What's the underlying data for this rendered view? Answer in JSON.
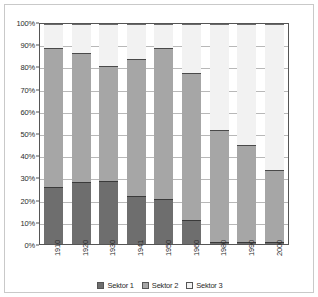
{
  "chart_data": {
    "type": "bar",
    "stacked": true,
    "stack_mode": "percent",
    "title": "",
    "subtitle": "",
    "xlabel": "",
    "ylabel": "",
    "ylim": [
      0,
      100
    ],
    "ytick_labels": [
      "100%",
      "90%",
      "80%",
      "70%",
      "60%",
      "50%",
      "40%",
      "30%",
      "20%",
      "10%",
      "0%"
    ],
    "ytick_values": [
      100,
      90,
      80,
      70,
      60,
      50,
      40,
      30,
      20,
      10,
      0
    ],
    "grid": true,
    "grid_axis": "y",
    "legend_position": "bottom",
    "categories": [
      "1910",
      "1920",
      "1930",
      "1941",
      "1950",
      "1960",
      "1980",
      "1990",
      "2000"
    ],
    "series": [
      {
        "name": "Sektor 1",
        "color": "#6e6e6e",
        "values": [
          26.0,
          28.0,
          28.5,
          22.0,
          20.5,
          11.0,
          1.0,
          1.0,
          1.0
        ]
      },
      {
        "name": "Sektor 2",
        "color": "#a6a6a6",
        "values": [
          63.0,
          59.0,
          52.5,
          62.0,
          68.5,
          66.5,
          51.0,
          44.0,
          32.5
        ]
      },
      {
        "name": "Sektor 3",
        "color": "#f2f2f2",
        "values": [
          11.0,
          13.0,
          19.0,
          16.0,
          11.0,
          22.5,
          48.0,
          55.0,
          66.5
        ]
      }
    ],
    "cumulative_tops": [
      {
        "category": "1910",
        "s1_top": 26.0,
        "s2_top": 89.0
      },
      {
        "category": "1920",
        "s1_top": 28.0,
        "s2_top": 87.0
      },
      {
        "category": "1930",
        "s1_top": 28.5,
        "s2_top": 81.0
      },
      {
        "category": "1941",
        "s1_top": 22.0,
        "s2_top": 84.0
      },
      {
        "category": "1950",
        "s1_top": 20.5,
        "s2_top": 89.0
      },
      {
        "category": "1960",
        "s1_top": 11.0,
        "s2_top": 77.5
      },
      {
        "category": "1980",
        "s1_top": 1.0,
        "s2_top": 52.0
      },
      {
        "category": "1990",
        "s1_top": 1.0,
        "s2_top": 45.0
      },
      {
        "category": "2000",
        "s1_top": 1.0,
        "s2_top": 33.5
      }
    ]
  },
  "legend": {
    "items": [
      {
        "label": "Sektor 1",
        "color": "#6e6e6e"
      },
      {
        "label": "Sektor 2",
        "color": "#a6a6a6"
      },
      {
        "label": "Sektor 3",
        "color": "#f2f2f2"
      }
    ]
  },
  "colors": {
    "sektor1": "#6e6e6e",
    "sektor2": "#a6a6a6",
    "sektor3": "#f2f2f2",
    "axis": "#555555",
    "grid": "#b8b8b8",
    "frame": "#c9c9c9",
    "text": "#2b2b2b",
    "background": "#ffffff"
  }
}
